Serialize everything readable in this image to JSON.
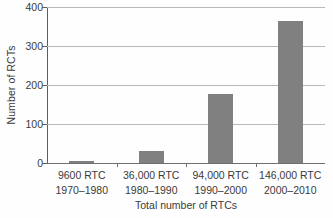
{
  "chart_data": {
    "type": "bar",
    "title": "",
    "subtitle": "",
    "xlabel": "Total number of RTCs",
    "ylabel": "Number of RCTs",
    "categories": [
      "9600 RTC\n1970–1980",
      "36,000 RTC\n1980–1990",
      "94,000 RTC\n1990–2000",
      "146,000 RTC\n2000–2010"
    ],
    "category_lines": [
      {
        "line1": "9600 RTC",
        "line2": "1970–1980"
      },
      {
        "line1": "36,000 RTC",
        "line2": "1980–1990"
      },
      {
        "line1": "94,000 RTC",
        "line2": "1990–2000"
      },
      {
        "line1": "146,000 RTC",
        "line2": "2000–2010"
      }
    ],
    "values": [
      5,
      31,
      177,
      363
    ],
    "ylim": [
      0,
      400
    ],
    "yticks": [
      0,
      100,
      200,
      300,
      400
    ],
    "ytick_labels": [
      "0",
      "100",
      "200",
      "300",
      "400"
    ],
    "grid": true,
    "legend": false,
    "legend_position": "none",
    "bar_color": "#808080",
    "gridline_color": "#b9b9b9",
    "axis_color": "#5d5d5d",
    "background_color": "#ffffff"
  }
}
